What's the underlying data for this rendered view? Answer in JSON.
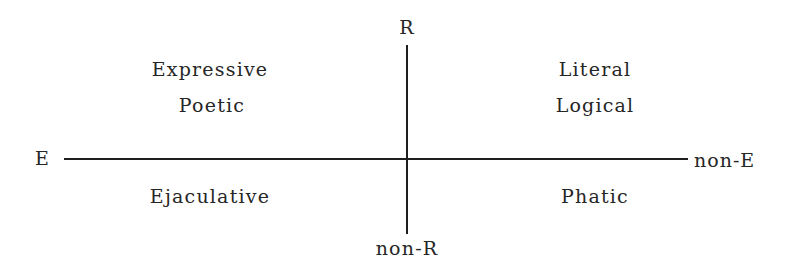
{
  "diagram": {
    "axes": {
      "vertical": {
        "top_label": "R",
        "bottom_label": "non-R"
      },
      "horizontal": {
        "left_label": "E",
        "right_label": "non-E"
      }
    },
    "quadrants": {
      "top_left": [
        "Expressive",
        "Poetic"
      ],
      "top_right": [
        "Literal",
        "Logical"
      ],
      "bottom_left": [
        "Ejaculative"
      ],
      "bottom_right": [
        "Phatic"
      ]
    },
    "colors": {
      "line": "#1e1e1e",
      "text": "#262626",
      "background": "#ffffff"
    }
  }
}
